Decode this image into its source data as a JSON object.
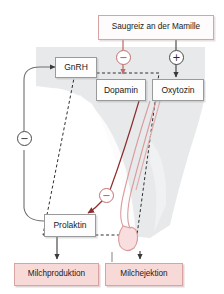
{
  "diagram": {
    "language": "de",
    "colors": {
      "box_white_fill": "#fdfdfd",
      "box_white_border": "#9a9a9a",
      "box_pinkline_border": "#d9a3a3",
      "box_pink_fill": "#f7dad8",
      "brain_shade": "#e4e6e8",
      "vessel_red": "#cf8b8b",
      "arrow_dark_red": "#8e2b2b",
      "arrow_black": "#3a3a3a",
      "dashed_outline": "#2f2f2f"
    },
    "nodes": [
      {
        "id": "saugreiz",
        "label": "Saugreiz an der Mamille",
        "style": "pinkline"
      },
      {
        "id": "gnrh",
        "label": "GnRH",
        "style": "white"
      },
      {
        "id": "dopamin",
        "label": "Dopamin",
        "style": "white"
      },
      {
        "id": "oxytozin",
        "label": "Oxytozin",
        "style": "white"
      },
      {
        "id": "prolaktin",
        "label": "Prolaktin",
        "style": "white"
      },
      {
        "id": "milchproduktion",
        "label": "Milchproduktion",
        "style": "pink"
      },
      {
        "id": "milchejektion",
        "label": "Milchejektion",
        "style": "pink"
      }
    ],
    "signs": [
      {
        "id": "sign-inhibit-dopamin",
        "glyph": "−",
        "color": "red",
        "meaning": "Saugreiz hemmt Dopamin"
      },
      {
        "id": "sign-stimulate-oxytozin",
        "glyph": "+",
        "color": "black",
        "meaning": "Saugreiz stimuliert Oxytozin"
      },
      {
        "id": "sign-inhibit-gnrh",
        "glyph": "−",
        "color": "black",
        "meaning": "Prolaktin hemmt GnRH"
      },
      {
        "id": "sign-inhibit-prolaktin",
        "glyph": "−",
        "color": "red",
        "meaning": "Dopamin hemmt Prolaktin"
      }
    ],
    "edges": [
      {
        "from": "saugreiz",
        "to": "dopamin",
        "sign": "−",
        "kind": "inhibition"
      },
      {
        "from": "saugreiz",
        "to": "oxytozin",
        "sign": "+",
        "kind": "stimulation"
      },
      {
        "from": "dopamin",
        "to": "prolaktin",
        "sign": "−",
        "kind": "inhibition"
      },
      {
        "from": "prolaktin",
        "to": "gnrh",
        "sign": "−",
        "kind": "inhibition"
      },
      {
        "from": "prolaktin",
        "to": "milchproduktion",
        "sign": "",
        "kind": "effect"
      },
      {
        "from": "oxytozin",
        "to": "milchejektion",
        "sign": "",
        "kind": "effect"
      }
    ],
    "annotations": {
      "prolaktin_marker": "↗",
      "portal_system": "gestrichelter Umriss: Hypophysenstiel / Portalsystem"
    }
  }
}
